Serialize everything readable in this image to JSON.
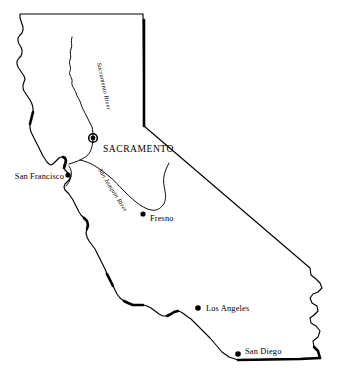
{
  "map": {
    "title": "California",
    "background_color": "#ffffff",
    "line_color": "#000000",
    "capital": {
      "name": "SACRAMENTO",
      "marker": "capital-ring-dot",
      "x": 93,
      "y": 138,
      "label_x": 103,
      "label_y": 152
    },
    "cities": [
      {
        "name": "San Francisco",
        "marker": "filled-dot",
        "x": 68,
        "y": 175,
        "label_x": 64,
        "label_y": 179,
        "label_anchor": "end"
      },
      {
        "name": "Fresno",
        "marker": "filled-dot",
        "x": 143,
        "y": 214,
        "label_x": 150,
        "label_y": 221,
        "label_anchor": "start"
      },
      {
        "name": "Los Angeles",
        "marker": "filled-dot",
        "x": 198,
        "y": 308,
        "label_x": 206,
        "label_y": 311,
        "label_anchor": "start"
      },
      {
        "name": "San Diego",
        "marker": "filled-dot",
        "x": 238,
        "y": 354,
        "label_x": 245,
        "label_y": 354,
        "label_anchor": "start"
      }
    ],
    "rivers": [
      {
        "name": "Sacramento River",
        "label_x": 97,
        "label_y": 63,
        "label_rotation": 78
      },
      {
        "name": "San Joaquin River",
        "label_x": 98,
        "label_y": 170,
        "label_rotation": 58
      }
    ]
  }
}
